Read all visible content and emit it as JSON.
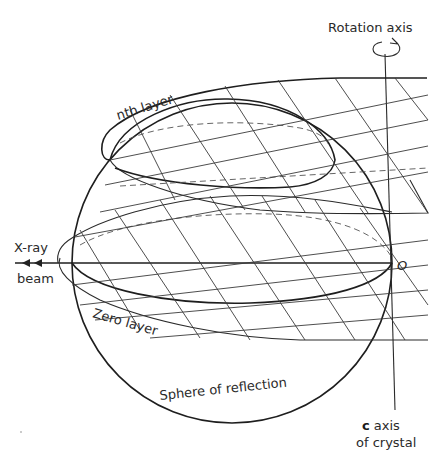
{
  "labels": {
    "rotation_axis": "Rotation axis",
    "nth_layer": "nth layer",
    "x_ray": "X-ray",
    "beam": "beam",
    "origin": "O",
    "zero_layer": "Zero layer",
    "sphere": "Sphere of reflection",
    "c_axis_bold": "c",
    "c_axis_rest": " axis",
    "of_crystal": "of crystal"
  },
  "colors": {
    "ink": "#2a2a2a",
    "background": "#ffffff"
  }
}
